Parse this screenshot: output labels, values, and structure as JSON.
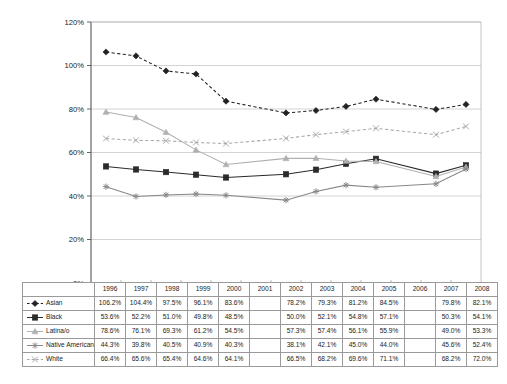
{
  "chart_data": {
    "type": "line",
    "title": "",
    "subtitle": "",
    "xlabel": "",
    "ylabel": "",
    "grid": true,
    "legend_position": "table-left",
    "ylim": [
      0,
      120
    ],
    "ytick_labels": [
      "0%",
      "20%",
      "40%",
      "60%",
      "80%",
      "100%",
      "120%"
    ],
    "ytick_values": [
      0,
      20,
      40,
      60,
      80,
      100,
      120
    ],
    "categories": [
      "1996",
      "1997",
      "1998",
      "1999",
      "2000",
      "2001",
      "2002",
      "2003",
      "2004",
      "2005",
      "2006",
      "2007",
      "2008"
    ],
    "series": [
      {
        "name": "Asian",
        "marker": "diamond",
        "line_style": "dashed",
        "color": "#222222",
        "values": [
          106.2,
          104.4,
          97.5,
          96.1,
          83.6,
          null,
          78.2,
          79.3,
          81.2,
          84.5,
          null,
          79.8,
          82.1
        ],
        "labels": [
          "106.2%",
          "104.4%",
          "97.5%",
          "96.1%",
          "83.6%",
          "",
          "78.2%",
          "79.3%",
          "81.2%",
          "84.5%",
          "",
          "79.8%",
          "82.1%"
        ]
      },
      {
        "name": "Black",
        "marker": "square",
        "line_style": "solid",
        "color": "#2b2b2b",
        "values": [
          53.6,
          52.2,
          51.0,
          49.8,
          48.5,
          null,
          50.0,
          52.1,
          54.8,
          57.1,
          null,
          50.3,
          54.1
        ],
        "labels": [
          "53.6%",
          "52.2%",
          "51.0%",
          "49.8%",
          "48.5%",
          "",
          "50.0%",
          "52.1%",
          "54.8%",
          "57.1%",
          "",
          "50.3%",
          "54.1%"
        ]
      },
      {
        "name": "Latina/o",
        "marker": "triangle",
        "line_style": "solid",
        "color": "#b0b0b0",
        "values": [
          78.6,
          76.1,
          69.3,
          61.2,
          54.5,
          null,
          57.3,
          57.4,
          56.1,
          55.9,
          null,
          49.0,
          53.3
        ],
        "labels": [
          "78.6%",
          "76.1%",
          "69.3%",
          "61.2%",
          "54.5%",
          "",
          "57.3%",
          "57.4%",
          "56.1%",
          "55.9%",
          "",
          "49.0%",
          "53.3%"
        ]
      },
      {
        "name": "Native American",
        "marker": "star",
        "line_style": "solid",
        "color": "#888888",
        "values": [
          44.3,
          39.8,
          40.5,
          40.9,
          40.3,
          null,
          38.1,
          42.1,
          45.0,
          44.0,
          null,
          45.6,
          52.4
        ],
        "labels": [
          "44.3%",
          "39.8%",
          "40.5%",
          "40.9%",
          "40.3%",
          "",
          "38.1%",
          "42.1%",
          "45.0%",
          "44.0%",
          "",
          "45.6%",
          "52.4%"
        ]
      },
      {
        "name": "White",
        "marker": "cross",
        "line_style": "dashed",
        "color": "#a8a8a8",
        "values": [
          66.4,
          65.6,
          65.4,
          64.6,
          64.1,
          null,
          66.5,
          68.2,
          69.6,
          71.1,
          null,
          68.2,
          72.0
        ],
        "labels": [
          "66.4%",
          "65.6%",
          "65.4%",
          "64.6%",
          "64.1%",
          "",
          "66.5%",
          "68.2%",
          "69.6%",
          "71.1%",
          "",
          "68.2%",
          "72.0%"
        ]
      }
    ]
  },
  "table": {
    "corner_label": "",
    "column_headers": [
      "1996",
      "1997",
      "1998",
      "1999",
      "2000",
      "2001",
      "2002",
      "2003",
      "2004",
      "2005",
      "2006",
      "2007",
      "2008"
    ],
    "rows": [
      {
        "label": "Asian",
        "marker": "diamond",
        "cells": [
          "106.2%",
          "104.4%",
          "97.5%",
          "96.1%",
          "83.6%",
          "",
          "78.2%",
          "79.3%",
          "81.2%",
          "84.5%",
          "",
          "79.8%",
          "82.1%"
        ]
      },
      {
        "label": "Black",
        "marker": "square",
        "cells": [
          "53.6%",
          "52.2%",
          "51.0%",
          "49.8%",
          "48.5%",
          "",
          "50.0%",
          "52.1%",
          "54.8%",
          "57.1%",
          "",
          "50.3%",
          "54.1%"
        ]
      },
      {
        "label": "Latina/o",
        "marker": "triangle",
        "cells": [
          "78.6%",
          "76.1%",
          "69.3%",
          "61.2%",
          "54.5%",
          "",
          "57.3%",
          "57.4%",
          "56.1%",
          "55.9%",
          "",
          "49.0%",
          "53.3%"
        ]
      },
      {
        "label": "Native American",
        "marker": "star",
        "cells": [
          "44.3%",
          "39.8%",
          "40.5%",
          "40.9%",
          "40.3%",
          "",
          "38.1%",
          "42.1%",
          "45.0%",
          "44.0%",
          "",
          "45.6%",
          "52.4%"
        ]
      },
      {
        "label": "White",
        "marker": "cross",
        "cells": [
          "66.4%",
          "65.6%",
          "65.4%",
          "64.6%",
          "64.1%",
          "",
          "66.5%",
          "68.2%",
          "69.6%",
          "71.1%",
          "",
          "68.2%",
          "72.0%"
        ]
      }
    ]
  },
  "axis": {
    "y_labels": [
      "120%",
      "100%",
      "80%",
      "60%",
      "40%",
      "20%",
      "0%"
    ]
  },
  "colors": {
    "asian": "#222222",
    "black": "#2b2b2b",
    "latino": "#b0b0b0",
    "native_american": "#888888",
    "white": "#a8a8a8",
    "gridline": "#c8c8c8",
    "axis": "#555555",
    "table_border": "#9a9a9a"
  }
}
